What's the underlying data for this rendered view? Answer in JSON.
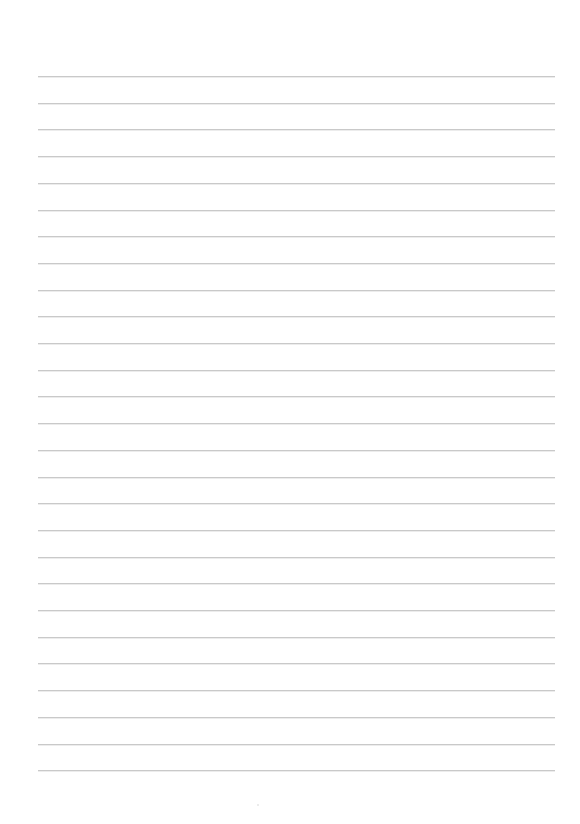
{
  "page": {
    "type": "lined-paper",
    "background_color": "#ffffff",
    "line_color": "#c9c9c9",
    "line_count": 27,
    "first_line_y": 76,
    "line_spacing": 26.7,
    "line_left_x": 38,
    "line_right_x": 555,
    "content_text": ""
  }
}
